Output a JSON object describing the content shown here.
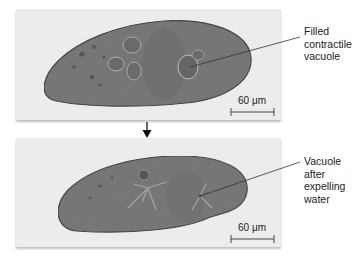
{
  "figure": {
    "panels": [
      {
        "id": "before",
        "state": "filled contractile vacuole",
        "label_lines": [
          "Filled",
          "contractile",
          "vacuole"
        ],
        "scale_bar": "60 μm"
      },
      {
        "id": "after",
        "state": "vacuole after expelling water",
        "label_lines": [
          "Vacuole",
          "after",
          "expelling",
          "water"
        ],
        "scale_bar": "60 μm"
      }
    ],
    "arrow": "down-arrow"
  },
  "colors": {
    "panel_background": "#ececec",
    "cell_fill": "#7a7a7a",
    "cell_edge": "#4a4a4a",
    "text": "#222222",
    "leader_line": "#333333"
  }
}
